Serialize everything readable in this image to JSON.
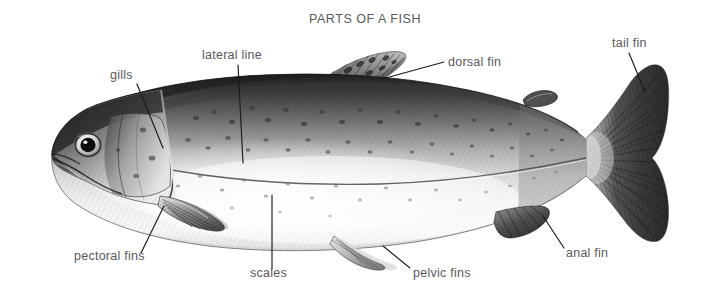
{
  "page": {
    "title": "PARTS OF A FISH",
    "background_color": "#ffffff",
    "text_color": "#59595b",
    "leader_color": "#1b1b1b",
    "width": 719,
    "height": 300
  },
  "illustration": {
    "name": "fish-illustration",
    "subject": "trout",
    "medium": "graphite pencil drawing",
    "orientation": "left-facing lateral view",
    "description": "Detailed monochrome pencil rendering of a trout shown in side profile, head at left and tail at right, with a dark speckled back, pale silvery belly, visible lateral line and seven fins.",
    "tone_dark": "#2a2a2a",
    "tone_mid": "#8d8d8d",
    "tone_light": "#e9e9e9"
  },
  "labels": [
    {
      "id": "gills",
      "text": "gills",
      "text_x": 110,
      "text_y": 79,
      "anchor": "start",
      "leader": "M 137 84 L 163 148"
    },
    {
      "id": "lateral-line",
      "text": "lateral line",
      "text_x": 202,
      "text_y": 59,
      "anchor": "start",
      "leader": "M 238 65 L 243 163"
    },
    {
      "id": "dorsal-fin",
      "text": "dorsal fin",
      "text_x": 448,
      "text_y": 66,
      "anchor": "start",
      "leader": "M 444 62 L 382 79"
    },
    {
      "id": "tail-fin",
      "text": "tail fin",
      "text_x": 612,
      "text_y": 47,
      "anchor": "start",
      "leader": "M 629 53 L 645 92"
    },
    {
      "id": "pectoral-fins",
      "text": "pectoral fins",
      "text_x": 74,
      "text_y": 260,
      "anchor": "start",
      "leader": "M 141 253 L 164 206"
    },
    {
      "id": "scales",
      "text": "scales",
      "text_x": 250,
      "text_y": 277,
      "anchor": "start",
      "leader": "M 272 269 L 272 195"
    },
    {
      "id": "pelvic-fins",
      "text": "pelvic fins",
      "text_x": 413,
      "text_y": 277,
      "anchor": "start",
      "leader": "M 410 268 L 383 246"
    },
    {
      "id": "anal-fin",
      "text": "anal fin",
      "text_x": 566,
      "text_y": 257,
      "anchor": "start",
      "leader": "M 564 248 L 543 216"
    }
  ]
}
